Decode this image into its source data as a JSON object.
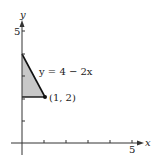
{
  "diagram": {
    "axes": {
      "x_label": "x",
      "y_label": "y",
      "x_tick_label": "5",
      "y_tick_label": "5",
      "x_ticks": [
        1,
        2,
        3,
        4,
        5
      ],
      "y_ticks": [
        1,
        2,
        3,
        4,
        5
      ]
    },
    "region": {
      "vertices": [
        [
          0,
          2
        ],
        [
          0,
          4
        ],
        [
          1,
          2
        ]
      ],
      "fill": "#c8c8c8"
    },
    "curve_label": "y = 4 − 2x",
    "point_label": "(1, 2)",
    "point": [
      1,
      2
    ]
  }
}
